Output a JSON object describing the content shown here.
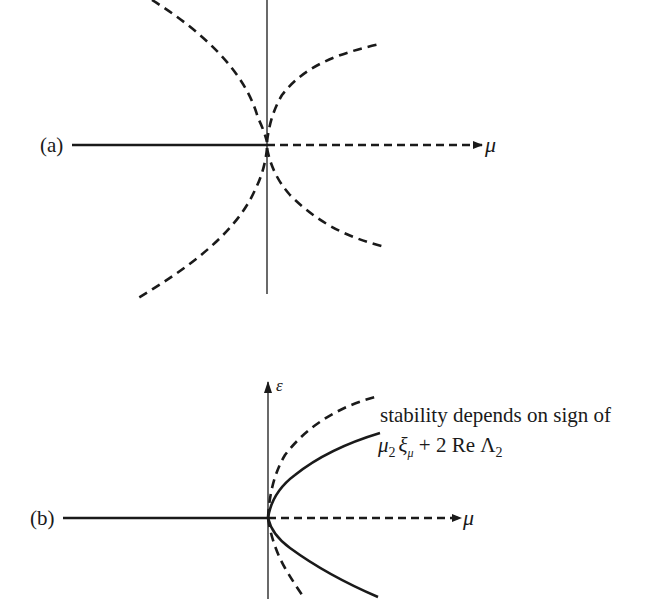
{
  "diagram": {
    "type": "bifurcation-diagram",
    "ink_color": "#1a1a1a",
    "panels": [
      {
        "id": "a",
        "label": "(a)",
        "horizontal_axis_label": "μ",
        "vertical_axis_label": "",
        "branches": [
          {
            "name": "trivial-left",
            "style": "solid",
            "description": "horizontal branch for μ<0"
          },
          {
            "name": "trivial-right",
            "style": "dashed",
            "description": "horizontal branch for μ>0"
          },
          {
            "name": "upper-left",
            "style": "dashed"
          },
          {
            "name": "upper-right",
            "style": "dashed"
          },
          {
            "name": "lower-left",
            "style": "dashed"
          },
          {
            "name": "lower-right",
            "style": "dashed"
          }
        ]
      },
      {
        "id": "b",
        "label": "(b)",
        "horizontal_axis_label": "μ",
        "vertical_axis_label": "ε",
        "branches": [
          {
            "name": "trivial-left",
            "style": "solid"
          },
          {
            "name": "trivial-right",
            "style": "dashed"
          },
          {
            "name": "upper-outer",
            "style": "dashed"
          },
          {
            "name": "upper-inner",
            "style": "solid"
          },
          {
            "name": "lower-inner",
            "style": "solid"
          },
          {
            "name": "lower-outer",
            "style": "dashed"
          }
        ],
        "annotation": {
          "line1": "stability depends on sign of",
          "line2_parts": {
            "mu": "μ",
            "mu_sub": "2",
            "xi": "ξ",
            "xi_sub": "μ",
            "plus_two_re": " + 2 Re ",
            "lambda": "Λ",
            "lambda_sub": "2"
          }
        }
      }
    ]
  }
}
